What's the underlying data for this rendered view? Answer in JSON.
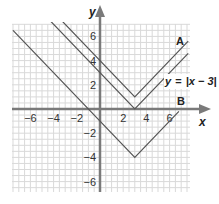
{
  "chart_data": {
    "type": "line",
    "title": "",
    "xlabel": "x",
    "ylabel": "y",
    "xlim": [
      -7.5,
      7.8
    ],
    "ylim": [
      -7.2,
      7.4
    ],
    "grid": true,
    "x_ticks": [
      -6,
      -4,
      -2,
      2,
      4,
      6
    ],
    "y_ticks": [
      6,
      4,
      2,
      -2,
      -4,
      -6
    ],
    "x_tick_labels": [
      "−6",
      "−4",
      "−2",
      "2",
      "4",
      "6"
    ],
    "y_tick_labels": [
      "6",
      "4",
      "2",
      "−2",
      "−4",
      "−6"
    ],
    "series": [
      {
        "name": "A",
        "equation": "y = |x − 3| + 1",
        "vertex": [
          3,
          1
        ],
        "points": [
          [
            -4.2,
            8.2
          ],
          [
            3,
            1
          ],
          [
            7.6,
            5.6
          ]
        ],
        "label": "A"
      },
      {
        "name": "y = |x − 3|",
        "equation": "y = |x − 3|",
        "vertex": [
          3,
          0
        ],
        "points": [
          [
            -5.2,
            8.2
          ],
          [
            3,
            0
          ],
          [
            7.6,
            4.6
          ]
        ],
        "label": "y = |x − 3|"
      },
      {
        "name": "B",
        "equation": "y = |x − 3| − 4",
        "vertex": [
          3,
          -4
        ],
        "points": [
          [
            -7.5,
            6.5
          ],
          [
            3,
            -4
          ],
          [
            6.8,
            -0.2
          ]
        ],
        "label": "B"
      }
    ],
    "labels": {
      "x_axis": "x",
      "y_axis": "y",
      "series_a": "A",
      "series_b": "B",
      "equation_prefix": "y",
      "equation_eq": "=",
      "equation_abs": "|x − 3|"
    },
    "line_color": "#555555",
    "axis_color": "#7a7a7a",
    "grid_color": "#d9d9d9"
  }
}
